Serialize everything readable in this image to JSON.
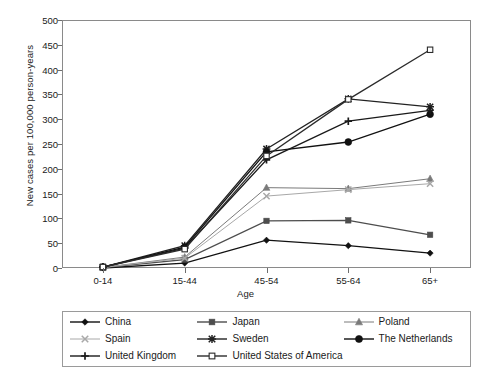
{
  "chart_data": {
    "type": "line",
    "title": "",
    "xlabel": "Age",
    "ylabel": "New cases per 100,000 person-years",
    "categories": [
      "0-14",
      "15-44",
      "45-54",
      "55-64",
      "65+"
    ],
    "ylim": [
      0,
      500
    ],
    "ytick_values": [
      0,
      50,
      100,
      150,
      200,
      250,
      300,
      350,
      400,
      450,
      500
    ],
    "grid": false,
    "legend_position": "bottom",
    "series": [
      {
        "name": "China",
        "marker": "diamond",
        "color": "#111111",
        "values": [
          0,
          10,
          56,
          45,
          30
        ]
      },
      {
        "name": "Japan",
        "marker": "square",
        "color": "#4d4d4d",
        "values": [
          1,
          17,
          95,
          96,
          67
        ]
      },
      {
        "name": "Poland",
        "marker": "triangle",
        "color": "#7a7a7a",
        "values": [
          1,
          22,
          162,
          160,
          180
        ]
      },
      {
        "name": "Spain",
        "marker": "cross-light",
        "color": "#a8a8a8",
        "values": [
          1,
          20,
          145,
          158,
          170
        ]
      },
      {
        "name": "Sweden",
        "marker": "asterisk",
        "color": "#222222",
        "values": [
          2,
          45,
          240,
          341,
          325
        ]
      },
      {
        "name": "The Netherlands",
        "marker": "circle",
        "color": "#111111",
        "values": [
          2,
          42,
          234,
          254,
          310
        ]
      },
      {
        "name": "United Kingdom",
        "marker": "plus",
        "color": "#1a1a1a",
        "values": [
          2,
          40,
          218,
          296,
          318
        ]
      },
      {
        "name": "United States of America",
        "marker": "open-square",
        "color": "#2b2b2b",
        "values": [
          2,
          38,
          226,
          340,
          440
        ]
      }
    ]
  },
  "axis": {
    "y_title": "New cases per 100,000 person-years",
    "x_title": "Age",
    "yticks": [
      "500",
      "450",
      "400",
      "350",
      "300",
      "250",
      "200",
      "150",
      "100",
      "50",
      "0"
    ],
    "xticks": [
      "0-14",
      "15-44",
      "45-54",
      "55-64",
      "65+"
    ]
  },
  "legend": {
    "items": [
      {
        "label": "China"
      },
      {
        "label": "Japan"
      },
      {
        "label": "Poland"
      },
      {
        "label": "Spain"
      },
      {
        "label": "Sweden"
      },
      {
        "label": "The Netherlands"
      },
      {
        "label": "United Kingdom"
      },
      {
        "label": "United States of America"
      }
    ]
  }
}
